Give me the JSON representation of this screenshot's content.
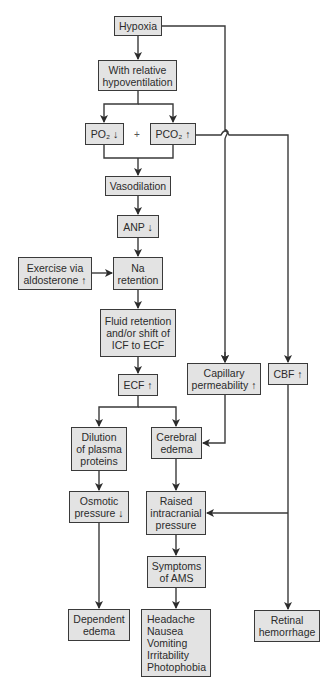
{
  "diagram": {
    "type": "flowchart",
    "colors": {
      "box_fill": "#e3e3e3",
      "box_border": "#3a3a3a",
      "line": "#3a3a3a",
      "background": "#ffffff"
    },
    "nodes": {
      "hypoxia": {
        "label": "Hypoxia"
      },
      "hypoventilation": {
        "label": "With relative\nhypoventilation"
      },
      "po2": {
        "label": "PO₂ ↓"
      },
      "plus": {
        "label": "+"
      },
      "pco2": {
        "label": "PCO₂ ↑"
      },
      "vasodilation": {
        "label": "Vasodilation"
      },
      "anp": {
        "label": "ANP ↓"
      },
      "exercise": {
        "label": "Exercise via\naldosterone ↑"
      },
      "na_retention": {
        "label": "Na\nretention"
      },
      "fluid_retention": {
        "label": "Fluid retention\nand/or shift of\nICF to ECF"
      },
      "ecf": {
        "label": "ECF ↑"
      },
      "capillary": {
        "label": "Capillary\npermeability ↑"
      },
      "cbf": {
        "label": "CBF ↑"
      },
      "dilution": {
        "label": "Dilution\nof plasma\nproteins"
      },
      "cerebral_edema": {
        "label": "Cerebral\nedema"
      },
      "osmotic": {
        "label": "Osmotic\npressure ↓"
      },
      "icp": {
        "label": "Raised\nintracranial\npressure"
      },
      "ams": {
        "label": "Symptoms\nof AMS"
      },
      "dependent_edema": {
        "label": "Dependent\nedema"
      },
      "symptoms_list": {
        "label": "Headache\nNausea\nVomiting\nIrritability\nPhotophobia"
      },
      "retinal": {
        "label": "Retinal\nhemorrhage"
      }
    },
    "edges": [
      [
        "Hypoxia",
        "With relative hypoventilation"
      ],
      [
        "Hypoxia",
        "Capillary permeability ↑"
      ],
      [
        "With relative hypoventilation",
        "PO₂ ↓"
      ],
      [
        "With relative hypoventilation",
        "PCO₂ ↑"
      ],
      [
        "PO₂ ↓ + PCO₂ ↑",
        "Vasodilation"
      ],
      [
        "PCO₂ ↑",
        "CBF ↑"
      ],
      [
        "Vasodilation",
        "ANP ↓"
      ],
      [
        "ANP ↓",
        "Na retention"
      ],
      [
        "Exercise via aldosterone ↑",
        "Na retention"
      ],
      [
        "Na retention",
        "Fluid retention and/or shift of ICF to ECF"
      ],
      [
        "Fluid retention and/or shift of ICF to ECF",
        "ECF ↑"
      ],
      [
        "ECF ↑",
        "Dilution of plasma proteins"
      ],
      [
        "ECF ↑",
        "Cerebral edema"
      ],
      [
        "Capillary permeability ↑",
        "Cerebral edema"
      ],
      [
        "Dilution of plasma proteins",
        "Osmotic pressure ↓"
      ],
      [
        "Cerebral edema",
        "Raised intracranial pressure"
      ],
      [
        "CBF ↑",
        "Raised intracranial pressure"
      ],
      [
        "CBF ↑",
        "Retinal hemorrhage"
      ],
      [
        "Osmotic pressure ↓",
        "Dependent edema"
      ],
      [
        "Raised intracranial pressure",
        "Symptoms of AMS"
      ],
      [
        "Symptoms of AMS",
        "Headache / Nausea / Vomiting / Irritability / Photophobia"
      ]
    ]
  }
}
